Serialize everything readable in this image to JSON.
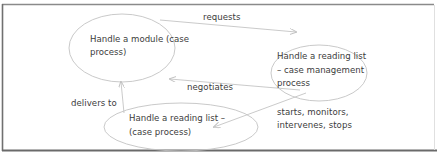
{
  "diagram": {
    "type": "process-relationship",
    "nodes": [
      {
        "id": "module",
        "label_line1": "Handle a module (case",
        "label_line2": "process)"
      },
      {
        "id": "reading-list-cm",
        "label_line1": "Handle a reading list",
        "label_line2": "– case management",
        "label_line3": "process"
      },
      {
        "id": "reading-list-case",
        "label_line1": "Handle a reading list –",
        "label_line2": "(case process)"
      }
    ],
    "edges": [
      {
        "from": "module",
        "to": "reading-list-cm",
        "label": "requests"
      },
      {
        "from": "reading-list-cm",
        "to": "module",
        "label": "negotiates"
      },
      {
        "from": "reading-list-case",
        "to": "module",
        "label": "delivers to"
      },
      {
        "from": "reading-list-cm",
        "to": "reading-list-case",
        "label_line1": "starts, monitors,",
        "label_line2": "intervenes, stops"
      }
    ],
    "colors": {
      "border": "#7a7a7a",
      "ellipse": "#bdbdbd",
      "arrow": "#c4c4c4",
      "text": "#3c3c3c"
    }
  }
}
